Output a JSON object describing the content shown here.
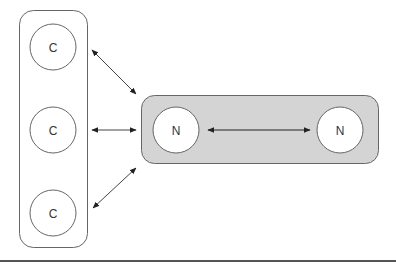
{
  "diagram": {
    "colors": {
      "stroke": "#666666",
      "arrow": "#222222",
      "group_fill": "#d4d4d4",
      "node_fill": "#ffffff",
      "baseline": "#555555"
    },
    "client_group": {
      "label": "",
      "nodes": [
        {
          "id": "c1",
          "label": "C"
        },
        {
          "id": "c2",
          "label": "C"
        },
        {
          "id": "c3",
          "label": "C"
        }
      ]
    },
    "server_group": {
      "label": "",
      "nodes": [
        {
          "id": "n1",
          "label": "N"
        },
        {
          "id": "n2",
          "label": "N"
        }
      ]
    },
    "edges": [
      {
        "from": "c1",
        "to": "server_group",
        "type": "bidirectional"
      },
      {
        "from": "c2",
        "to": "server_group",
        "type": "bidirectional"
      },
      {
        "from": "c3",
        "to": "server_group",
        "type": "bidirectional"
      },
      {
        "from": "n1",
        "to": "n2",
        "type": "bidirectional"
      }
    ]
  }
}
